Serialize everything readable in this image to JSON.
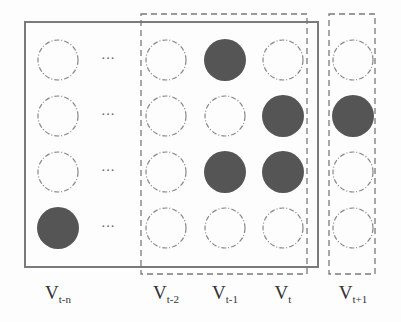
{
  "diagram": {
    "columns": [
      {
        "id": "t-n",
        "label_main": "V",
        "label_sub": "t-n",
        "x": 58,
        "nodes": [
          0,
          0,
          0,
          1
        ]
      },
      {
        "id": "ellipsis",
        "label_main": "",
        "label_sub": "",
        "x": 108,
        "ellipsis": "···"
      },
      {
        "id": "t-2",
        "label_main": "V",
        "label_sub": "t-2",
        "x": 166,
        "nodes": [
          0,
          0,
          0,
          0
        ]
      },
      {
        "id": "t-1",
        "label_main": "V",
        "label_sub": "t-1",
        "x": 225,
        "nodes": [
          1,
          0,
          1,
          0
        ]
      },
      {
        "id": "t",
        "label_main": "V",
        "label_sub": "t",
        "x": 283,
        "nodes": [
          0,
          1,
          1,
          0
        ]
      },
      {
        "id": "t+1",
        "label_main": "V",
        "label_sub": "t+1",
        "x": 353,
        "nodes": [
          0,
          1,
          0,
          0
        ]
      }
    ],
    "boxes": {
      "history_window": "solid rectangle spanning V_t-n to V_t",
      "input_window": "dashed rectangle spanning V_t-2 to V_t",
      "target": "dashed rectangle around V_t+1"
    },
    "colors": {
      "filled_node": "#555555",
      "empty_node_stroke": "#888888",
      "solid_box": "#777777",
      "dashed_box": "#777777"
    }
  }
}
